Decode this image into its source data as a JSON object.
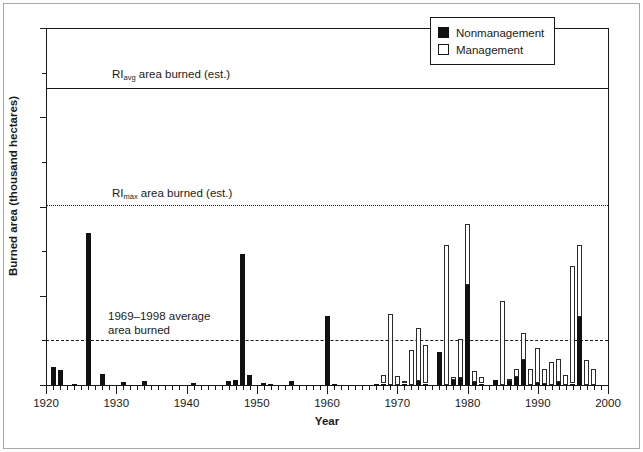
{
  "chart_data": {
    "type": "bar",
    "title": "",
    "xlabel": "Year",
    "ylabel": "Burned area (thousand hectares)",
    "xlim": [
      1920,
      2000
    ],
    "ylim": [
      0,
      12
    ],
    "xticks": [
      1920,
      1930,
      1940,
      1950,
      1960,
      1970,
      1980,
      1990,
      2000
    ],
    "yticks": [
      0,
      3,
      6,
      9,
      12
    ],
    "y_minor_ticks": [
      1.5,
      4.5,
      7.5,
      10.5
    ],
    "grid": false,
    "stacked": true,
    "legend_position": "top-right",
    "series": [
      {
        "name": "Nonmanagement",
        "color": "#111111",
        "fill": "solid"
      },
      {
        "name": "Management",
        "color": "#ffffff",
        "fill": "open"
      }
    ],
    "x": [
      1920,
      1921,
      1922,
      1923,
      1924,
      1925,
      1926,
      1927,
      1928,
      1929,
      1930,
      1931,
      1932,
      1933,
      1934,
      1935,
      1936,
      1937,
      1938,
      1939,
      1940,
      1941,
      1942,
      1943,
      1944,
      1945,
      1946,
      1947,
      1948,
      1949,
      1950,
      1951,
      1952,
      1953,
      1954,
      1955,
      1956,
      1957,
      1958,
      1959,
      1960,
      1961,
      1962,
      1963,
      1964,
      1965,
      1966,
      1967,
      1968,
      1969,
      1970,
      1971,
      1972,
      1973,
      1974,
      1975,
      1976,
      1977,
      1978,
      1979,
      1980,
      1981,
      1982,
      1983,
      1984,
      1985,
      1986,
      1987,
      1988,
      1989,
      1990,
      1991,
      1992,
      1993,
      1994,
      1995,
      1996,
      1997,
      1998,
      1999
    ],
    "nonmanagement": [
      0.0,
      0.6,
      0.52,
      0.0,
      0.05,
      0.0,
      5.12,
      0.0,
      0.38,
      0.0,
      0.0,
      0.1,
      0.0,
      0.0,
      0.12,
      0.0,
      0.0,
      0.0,
      0.0,
      0.0,
      0.0,
      0.06,
      0.0,
      0.0,
      0.0,
      0.0,
      0.13,
      0.18,
      4.42,
      0.34,
      0.0,
      0.06,
      0.05,
      0.0,
      0.0,
      0.12,
      0.0,
      0.0,
      0.0,
      0.0,
      2.32,
      0.04,
      0.0,
      0.0,
      0.0,
      0.0,
      0.0,
      0.04,
      0.05,
      0.0,
      0.0,
      0.05,
      0.0,
      0.14,
      0.03,
      0.0,
      1.1,
      0.0,
      0.18,
      0.25,
      3.35,
      0.1,
      0.05,
      0.0,
      0.18,
      0.0,
      0.12,
      0.28,
      0.85,
      0.0,
      0.06,
      0.05,
      0.0,
      0.1,
      0.0,
      0.04,
      2.3,
      0.0,
      0.0,
      0.0
    ],
    "management": [
      0.0,
      0.0,
      0.0,
      0.0,
      0.0,
      0.0,
      0.0,
      0.0,
      0.0,
      0.0,
      0.0,
      0.0,
      0.0,
      0.0,
      0.0,
      0.0,
      0.0,
      0.0,
      0.0,
      0.0,
      0.0,
      0.0,
      0.0,
      0.0,
      0.0,
      0.0,
      0.0,
      0.0,
      0.0,
      0.0,
      0.0,
      0.0,
      0.0,
      0.0,
      0.0,
      0.0,
      0.0,
      0.0,
      0.0,
      0.0,
      0.0,
      0.0,
      0.0,
      0.0,
      0.0,
      0.0,
      0.0,
      0.0,
      0.28,
      2.4,
      0.3,
      0.1,
      1.18,
      1.76,
      1.3,
      0.0,
      0.0,
      4.72,
      0.08,
      1.28,
      2.05,
      0.38,
      0.22,
      0.0,
      0.0,
      2.82,
      0.08,
      0.25,
      0.9,
      0.55,
      1.18,
      0.5,
      0.78,
      0.78,
      0.35,
      3.96,
      2.4,
      0.85,
      0.55,
      0.0
    ],
    "reference_lines": [
      {
        "id": "ri-avg",
        "value": 10.0,
        "style": "solid",
        "label": "RI",
        "label_sub": "avg",
        "label_rest": " area burned (est.)"
      },
      {
        "id": "ri-max",
        "value": 6.05,
        "style": "dotted",
        "label": "RI",
        "label_sub": "max",
        "label_rest": " area burned (est.)"
      },
      {
        "id": "avg-1969",
        "value": 1.52,
        "style": "dashed",
        "label": "",
        "label_sub": "",
        "label_rest": ""
      }
    ],
    "annotations": [
      {
        "id": "avg-annotation",
        "line1": "1969–1998 average",
        "line2": "area burned"
      }
    ]
  },
  "axis": {
    "y_tick_labels": [
      "0",
      "3",
      "6",
      "9",
      "12"
    ],
    "x_tick_labels": [
      "1920",
      "1930",
      "1940",
      "1950",
      "1960",
      "1970",
      "1980",
      "1990",
      "2000"
    ],
    "ylabel": "Burned area (thousand hectares)",
    "xlabel": "Year"
  },
  "legend": {
    "items": [
      {
        "label": "Nonmanagement",
        "swatch": "filled"
      },
      {
        "label": "Management",
        "swatch": "open"
      }
    ]
  },
  "reference_labels": {
    "ri_avg_prefix": "RI",
    "ri_avg_sub": "avg",
    "ri_avg_suffix": " area burned (est.)",
    "ri_max_prefix": "RI",
    "ri_max_sub": "max",
    "ri_max_suffix": " area burned (est.)"
  },
  "annotation": {
    "line1": "1969–1998 average",
    "line2": "area burned"
  },
  "colors": {
    "nonmanagement": "#111111",
    "management": "#ffffff",
    "axis": "#1a1a1a",
    "frame": "#a8a8a8",
    "background": "#ffffff"
  }
}
